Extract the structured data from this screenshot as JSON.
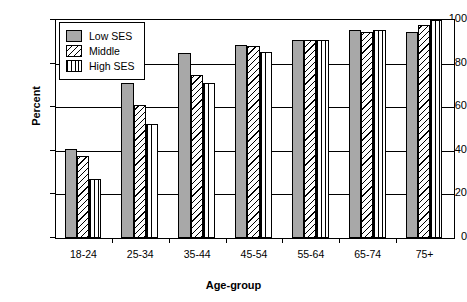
{
  "chart_data": {
    "type": "bar",
    "title": "",
    "xlabel": "Age-group",
    "ylabel": "Percent",
    "categories": [
      "18-24",
      "25-34",
      "35-44",
      "45-54",
      "55-64",
      "65-74",
      "75+"
    ],
    "series": [
      {
        "name": "Low SES",
        "pattern": "solid",
        "values": [
          41,
          71,
          85,
          88.5,
          91,
          95.5,
          94.5
        ]
      },
      {
        "name": "Middle",
        "pattern": "diagonal",
        "values": [
          37.5,
          61,
          75,
          88,
          91,
          94.5,
          97.5
        ]
      },
      {
        "name": "High SES",
        "pattern": "vertical",
        "values": [
          27,
          52.5,
          71,
          85.5,
          91,
          95.5,
          100
        ]
      }
    ],
    "ylim": [
      0,
      100
    ],
    "yticks": [
      0,
      20,
      40,
      60,
      80,
      100
    ],
    "ytick_labels": [
      "0",
      "20",
      "40",
      "60",
      "80",
      "100"
    ],
    "grid": true,
    "legend_position": "top-left",
    "colors": {
      "bar_fill_gray": "#a8a8a8",
      "bar_outline": "#000000",
      "axis": "#000000",
      "background": "#ffffff"
    }
  }
}
